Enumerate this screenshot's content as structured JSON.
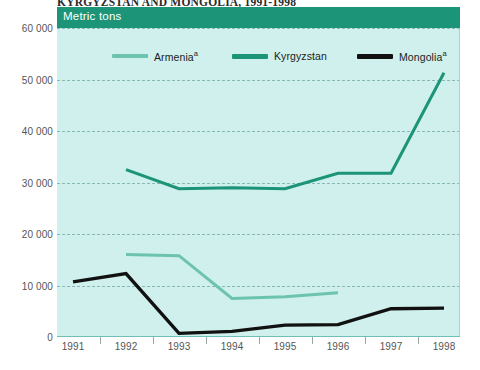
{
  "title": "KYRGYZSTAN AND MONGOLIA, 1991-1998",
  "unit_band_label": "Metric tons",
  "colors": {
    "band": "#1b9478",
    "plot_bg": "#cff0ec",
    "gridline": "#8ab9b5",
    "armenia": "#6cc3b0",
    "kyrgyzstan": "#1b9478",
    "mongolia": "#111111"
  },
  "legend": [
    {
      "name": "armenia",
      "label": "Armenia",
      "footnote": "a",
      "color": "#6cc3b0"
    },
    {
      "name": "kyrgyzstan",
      "label": "Kyrgyzstan",
      "footnote": "",
      "color": "#1b9478"
    },
    {
      "name": "mongolia",
      "label": "Mongolia",
      "footnote": "a",
      "color": "#111111"
    }
  ],
  "chart_data": {
    "type": "line",
    "title": "KYRGYZSTAN AND MONGOLIA, 1991-1998",
    "subtitle": "Metric tons",
    "xlabel": "",
    "ylabel": "Metric tons",
    "x": [
      1991,
      1992,
      1993,
      1994,
      1995,
      1996,
      1997,
      1998
    ],
    "xtick_labels": [
      "1991",
      "1992",
      "1993",
      "1994",
      "1995",
      "1996",
      "1997",
      "1998"
    ],
    "ytick_labels": [
      "0",
      "10 000",
      "20 000",
      "30 000",
      "40 000",
      "50 000",
      "60 000"
    ],
    "yticks": [
      0,
      10000,
      20000,
      30000,
      40000,
      50000,
      60000
    ],
    "ylim": [
      0,
      60000
    ],
    "grid": true,
    "legend_position": "top-inside",
    "series": [
      {
        "name": "Armenia",
        "footnote": "a",
        "color": "#6cc3b0",
        "x": [
          1992,
          1993,
          1994,
          1995,
          1996
        ],
        "values": [
          16000,
          15800,
          7500,
          7800,
          8600
        ]
      },
      {
        "name": "Kyrgyzstan",
        "footnote": "",
        "color": "#1b9478",
        "x": [
          1992,
          1993,
          1994,
          1995,
          1996,
          1997,
          1998
        ],
        "values": [
          32500,
          28800,
          29000,
          28800,
          31800,
          31800,
          51300
        ]
      },
      {
        "name": "Mongolia",
        "footnote": "a",
        "color": "#111111",
        "x": [
          1991,
          1992,
          1993,
          1994,
          1995,
          1996,
          1997,
          1998
        ],
        "values": [
          10700,
          12300,
          700,
          1100,
          2300,
          2400,
          5500,
          5600
        ]
      }
    ]
  }
}
